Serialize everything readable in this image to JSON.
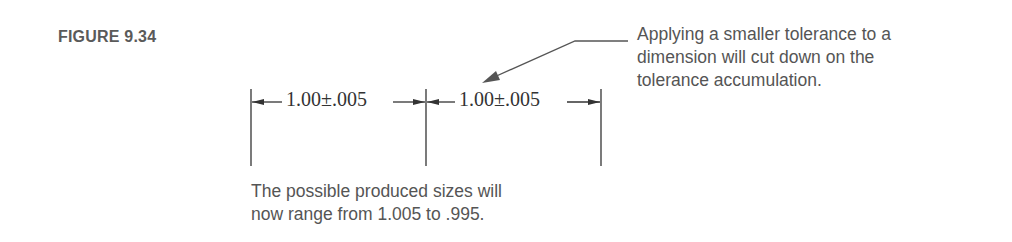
{
  "figure": {
    "label": "FIGURE 9.34",
    "callout": {
      "lines": [
        "Applying a smaller tolerance to a",
        "dimension will cut down on the",
        "tolerance accumulation."
      ]
    },
    "dimensions": [
      {
        "text": "1.00±.005",
        "nominal": 1.0,
        "tolerance": 0.005
      },
      {
        "text": "1.00±.005",
        "nominal": 1.0,
        "tolerance": 0.005
      }
    ],
    "caption": {
      "lines": [
        "The possible produced sizes will",
        "now range from 1.005 to .995."
      ]
    },
    "colors": {
      "line": "#333333",
      "text": "#555555",
      "leader_arrow": "#555555"
    }
  }
}
